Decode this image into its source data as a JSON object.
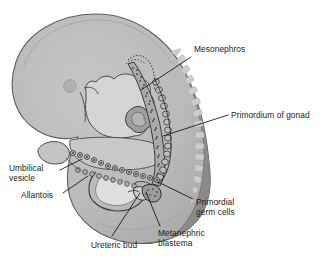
{
  "figure": {
    "background_color": "#ffffff",
    "body_fill": "#b9b9b9",
    "body_outline": "#5d5d5d",
    "somite_band_fill": "#8f8f8f",
    "somite_block_fill": "#c9c9c9",
    "inner_cavity_fill": "#d9d9d9",
    "gut_fill": "#c2c2c2",
    "cell_chain_fill": "#a0a0a0",
    "leader_line_color": "#111111",
    "label_text_color": "#1b1b1b"
  },
  "labels": [
    {
      "id": "mesonephros",
      "text": "Mesonephros",
      "x": 194,
      "y": 44,
      "align": "left",
      "lines": 1
    },
    {
      "id": "primordium-of-gonad",
      "text": "Primordium of gonad",
      "x": 231,
      "y": 110,
      "align": "left",
      "lines": 1
    },
    {
      "id": "umbilical-vesicle",
      "text": "Umbilical\nvesicle",
      "x": 9,
      "y": 163,
      "align": "left",
      "lines": 2
    },
    {
      "id": "allantois",
      "text": "Allantois",
      "x": 21,
      "y": 190,
      "align": "left",
      "lines": 1
    },
    {
      "id": "primordial-germ-cells",
      "text": "Primordial\ngerm cells",
      "x": 196,
      "y": 197,
      "align": "left",
      "lines": 2
    },
    {
      "id": "ureteric-bud",
      "text": "Ureteric bud",
      "x": 91,
      "y": 240,
      "align": "left",
      "lines": 1
    },
    {
      "id": "metanephric-blastema",
      "text": "Metanephric\nblastema",
      "x": 158,
      "y": 228,
      "align": "left",
      "lines": 2
    }
  ],
  "leader_lines": [
    {
      "id": "leader-mesonephros",
      "from": [
        191,
        57
      ],
      "to": [
        141,
        90
      ]
    },
    {
      "id": "leader-primordium-of-gonad",
      "from": [
        228,
        115
      ],
      "to": [
        163,
        136
      ]
    },
    {
      "id": "leader-umbilical-vesicle",
      "from": [
        60,
        170
      ],
      "to": [
        82,
        159
      ]
    },
    {
      "id": "leader-allantois",
      "from": [
        63,
        193
      ],
      "to": [
        88,
        176
      ]
    },
    {
      "id": "leader-primordial-germ-cells",
      "from": [
        193,
        199
      ],
      "to": [
        158,
        182
      ]
    },
    {
      "id": "leader-ureteric-bud",
      "from": [
        112,
        236
      ],
      "to": [
        140,
        193
      ]
    },
    {
      "id": "leader-metanephric-blastema",
      "from": [
        160,
        226
      ],
      "to": [
        146,
        192
      ]
    }
  ],
  "anatomy": {
    "structures": [
      "embryo body",
      "head / forebrain",
      "otic vesicle",
      "heart",
      "somite band",
      "mesonephros",
      "primordium of gonad",
      "primordial germ cells",
      "umbilical vesicle",
      "allantois",
      "ureteric bud",
      "metanephric blastema",
      "hindgut / cloaca"
    ]
  }
}
